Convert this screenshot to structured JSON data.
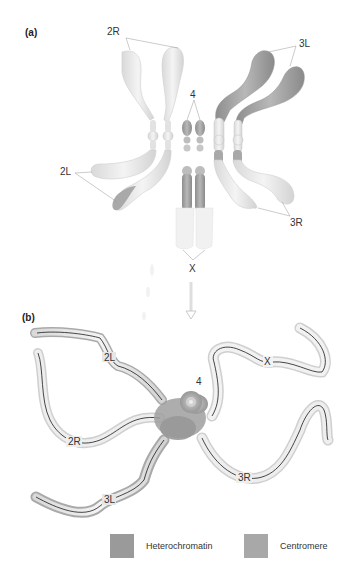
{
  "panels": {
    "a": {
      "label": "(a)"
    },
    "b": {
      "label": "(b)"
    }
  },
  "panel_a_labels": {
    "chr2R": "2R",
    "chr3L": "3L",
    "chr2L": "2L",
    "chr3R": "3R",
    "chr4": "4",
    "chrX": "X"
  },
  "panel_b_labels": {
    "chr2L": "2L",
    "chr2R": "2R",
    "chr3L": "3L",
    "chr3R": "3R",
    "chr4": "4",
    "chrX": "X"
  },
  "legend": {
    "items": [
      {
        "label": "Heterochromatin",
        "color": "#9a9a9a"
      },
      {
        "label": "Centromere",
        "color": "#a8a8a8"
      }
    ]
  },
  "colors": {
    "euchromatin": "#ececec",
    "heterochromatin": "#9a9a9a",
    "outline": "#c8c8c8",
    "polytene_line": "#1a1a1a",
    "arrow": "#bdbdbd"
  }
}
